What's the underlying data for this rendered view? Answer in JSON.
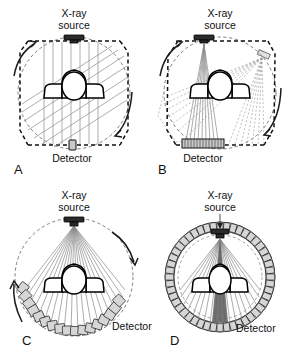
{
  "figure": {
    "colors": {
      "ray": "#8a8a8a",
      "orbit": "#6f6f6f",
      "source": "#2b2b2b",
      "detector": "#d6d6d6",
      "outline": "#000000",
      "background": "#ffffff"
    },
    "common_labels": {
      "xray_source_line1": "X-ray",
      "xray_source_line2": "source",
      "detector_line1": "Detector",
      "detector_pair_line2": "pair",
      "detector_array_line2": "array"
    },
    "panels": [
      {
        "letter": "A",
        "source_label_line1": "X-ray",
        "source_label_line2": "source",
        "detector_label_line1": "Detector",
        "detector_label_line2": "pair",
        "geometry": "translate-rotate pencil beam",
        "beam_type": "parallel",
        "ray_count": 7,
        "detector_elements": 1,
        "rotation": "clockwise",
        "translation_positions": 2
      },
      {
        "letter": "B",
        "source_label_line1": "X-ray",
        "source_label_line2": "source",
        "detector_label_line1": "Detector",
        "detector_label_line2": "array",
        "geometry": "translate-rotate narrow fan beam",
        "beam_type": "narrow fan",
        "ray_count": 9,
        "detector_elements": 14,
        "rotation": "clockwise",
        "translation_positions": 3
      },
      {
        "letter": "C",
        "source_label_line1": "X-ray",
        "source_label_line2": "source",
        "detector_label_line1": "Detector",
        "detector_label_line2": "array",
        "geometry": "rotate-rotate wide fan beam",
        "beam_type": "wide fan",
        "ray_count": 21,
        "detector_elements": 17,
        "rotation": "clockwise",
        "translation_positions": 1
      },
      {
        "letter": "D",
        "source_label_line1": "X-ray",
        "source_label_line2": "source",
        "detector_label_line1": "Detector",
        "detector_label_line2": "array",
        "geometry": "stationary detector ring, rotating source",
        "beam_type": "wide fan",
        "ray_count": 21,
        "detector_elements": 48,
        "rotation": "clockwise",
        "translation_positions": 0
      }
    ]
  }
}
